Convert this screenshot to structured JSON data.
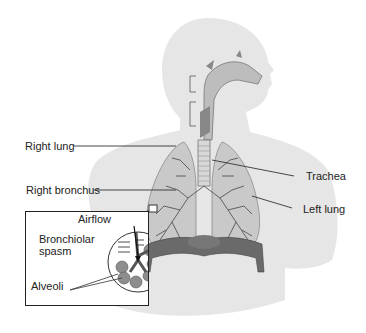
{
  "diagram": {
    "labels": {
      "right_lung": "Right lung",
      "right_bronchus": "Right bronchus",
      "trachea": "Trachea",
      "left_lung": "Left lung"
    },
    "inset": {
      "airflow": "Airflow",
      "spasm_line1": "Bronchiolar",
      "spasm_line2": "spasm",
      "alveoli": "Alveoli"
    },
    "colors": {
      "silhouette": "#e6e6e6",
      "lung_fill": "#c9c9c9",
      "lung_edge": "#8a8a8a",
      "airway": "#555555",
      "diaphragm": "#6a6a6a",
      "text": "#222222"
    }
  }
}
